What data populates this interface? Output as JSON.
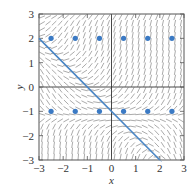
{
  "chart_data": {
    "type": "scatter",
    "subtype": "slope-field",
    "title": "",
    "xlabel": "x",
    "ylabel": "y",
    "xlim": [
      -3,
      3
    ],
    "ylim": [
      -3,
      3
    ],
    "xticks": [
      -3,
      -2,
      -1,
      0,
      1,
      2,
      3
    ],
    "yticks": [
      -3,
      -2,
      -1,
      0,
      1,
      2,
      3
    ],
    "xtick_labels": [
      "−3",
      "−2",
      "−1",
      "0",
      "1",
      "2",
      "3"
    ],
    "ytick_labels": [
      "−3",
      "−2",
      "−1",
      "0",
      "1",
      "2",
      "3"
    ],
    "grid": false,
    "legend": null,
    "series": [
      {
        "name": "highlighted-line",
        "kind": "line",
        "equation": "y = -x - 1",
        "points": [
          [
            -3,
            2
          ],
          [
            2,
            -3
          ]
        ],
        "color": "#4a86c5"
      },
      {
        "name": "points-y2",
        "kind": "scatter",
        "x": [
          -2.5,
          -1.5,
          -0.5,
          0.5,
          1.5,
          2.5
        ],
        "y": [
          2,
          2,
          2,
          2,
          2,
          2
        ],
        "color": "#3b7ac4"
      },
      {
        "name": "points-y-neg1",
        "kind": "scatter",
        "x": [
          -2.5,
          -1.5,
          -0.5,
          0.5,
          1.5,
          2.5
        ],
        "y": [
          -1,
          -1,
          -1,
          -1,
          -1,
          -1
        ],
        "color": "#3b7ac4"
      }
    ],
    "slope_field": {
      "grid_step": 0.25,
      "segment_color": "#444444",
      "description": "short line segments: near-horizontal along the region above the diagonal on the left and between y=-1 and y=1 on the right; steep positive in the upper right; steep negative below the diagonal"
    }
  },
  "colors": {
    "axis": "#555555",
    "line": "#4a86c5",
    "dot": "#3b7ac4",
    "segments": "#444444"
  }
}
